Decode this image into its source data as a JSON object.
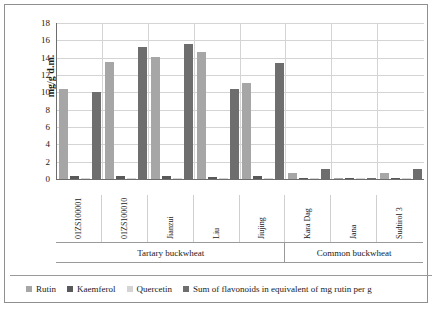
{
  "chart_data": {
    "type": "bar",
    "title": "",
    "xlabel": "",
    "ylabel": "mg/g d.m.",
    "ylim": [
      0,
      18
    ],
    "ytick_values": [
      18,
      16,
      14,
      12,
      10,
      8,
      6,
      4,
      2,
      0
    ],
    "grid": true,
    "legend_position": "bottom",
    "categories": [
      "01ZS100001",
      "01ZS100010",
      "Jianzui",
      "Liu",
      "Jiujing",
      "Kara Dag",
      "Jana",
      "Sudtirol 3"
    ],
    "category_groups": [
      {
        "label": "Tartary buckwheat",
        "span": 5
      },
      {
        "label": "Common buckwheat",
        "span": 3
      }
    ],
    "series": [
      {
        "name": "Rutin",
        "color": "#a6a6a6",
        "values": [
          10.4,
          13.5,
          14.1,
          14.7,
          11.1,
          0.7,
          0.1,
          0.75
        ]
      },
      {
        "name": "Kaemferol",
        "color": "#595959",
        "values": [
          0.3,
          0.35,
          0.3,
          0.25,
          0.3,
          0.05,
          0.15,
          0.1
        ]
      },
      {
        "name": "Quercetin",
        "color": "#d4d4d4",
        "values": [
          0.05,
          0.05,
          0.05,
          0.05,
          0.05,
          0.05,
          0.05,
          0.05
        ]
      },
      {
        "name": "Sum of flavonoids in equivalent of mg rutin per g",
        "color": "#6e6e6e",
        "values": [
          10.0,
          15.2,
          15.6,
          10.4,
          13.4,
          1.2,
          0.15,
          1.1
        ]
      }
    ]
  }
}
